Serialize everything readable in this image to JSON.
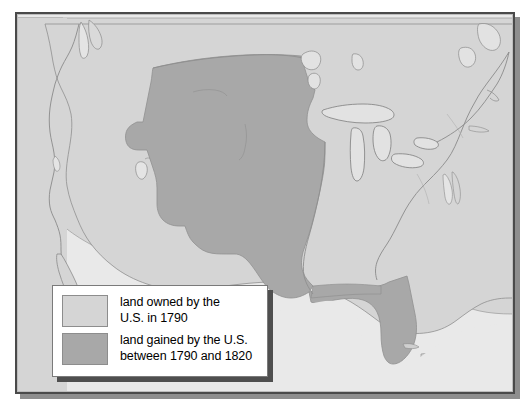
{
  "map": {
    "title": "United States territorial expansion 1790-1820",
    "colors": {
      "frame_border": "#4a4a4a",
      "ocean_background": "#e9e9e9",
      "land_owned_1790": "#d5d5d5",
      "land_gained_1790_1820": "#a8a8a8",
      "coastline_stroke": "#8a8a8a",
      "legend_background": "#ffffff",
      "legend_border": "#7a7a7a",
      "shadow": "#8e8e8e"
    },
    "regions": [
      {
        "name": "land-owned-1790",
        "label": "land owned by the U.S. in 1790",
        "fill": "#d5d5d5"
      },
      {
        "name": "land-gained-1790-1820",
        "label": "land gained by the U.S. between 1790 and 1820",
        "fill": "#a8a8a8",
        "includes": [
          "Louisiana Purchase",
          "Florida"
        ]
      }
    ],
    "features": [
      "Pacific coastline",
      "Great Lakes",
      "Mississippi River boundary",
      "Florida peninsula",
      "Florida Keys",
      "Great Salt Lake",
      "Atlantic coastline",
      "Gulf of Mexico"
    ]
  },
  "legend": {
    "items": [
      {
        "swatch_color": "#d5d5d5",
        "text": "land owned by the\nU.S. in 1790"
      },
      {
        "swatch_color": "#a8a8a8",
        "text": "land gained by the U.S.\nbetween 1790 and 1820"
      }
    ]
  }
}
